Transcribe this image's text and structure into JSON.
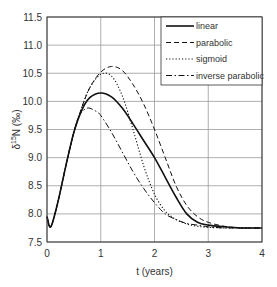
{
  "chart_data": {
    "type": "line",
    "title": "",
    "xlabel": "t (years)",
    "ylabel": "δ¹⁵N (‰)",
    "xlim": [
      0,
      4
    ],
    "ylim": [
      7.5,
      11.5
    ],
    "xticks": [
      "0",
      "1",
      "2",
      "3",
      "4"
    ],
    "yticks": [
      "7.5",
      "8.0",
      "8.5",
      "9.0",
      "9.5",
      "10.0",
      "10.5",
      "11.0",
      "11.5"
    ],
    "grid": true,
    "legend_position": "upper right",
    "series": [
      {
        "name": "linear",
        "style": "solid",
        "x": [
          0,
          0.07,
          0.2,
          0.35,
          0.5,
          0.65,
          0.8,
          1.0,
          1.2,
          1.4,
          1.6,
          1.8,
          2.0,
          2.2,
          2.4,
          2.6,
          2.8,
          3.0,
          3.3,
          3.6,
          4.0
        ],
        "y": [
          7.95,
          7.77,
          8.2,
          8.85,
          9.45,
          9.85,
          10.07,
          10.15,
          10.08,
          9.88,
          9.6,
          9.3,
          9.0,
          8.65,
          8.3,
          8.0,
          7.85,
          7.8,
          7.77,
          7.75,
          7.75
        ]
      },
      {
        "name": "parabolic",
        "style": "dashed",
        "x": [
          0,
          0.07,
          0.2,
          0.35,
          0.5,
          0.65,
          0.8,
          1.0,
          1.2,
          1.4,
          1.6,
          1.8,
          2.0,
          2.2,
          2.4,
          2.6,
          2.8,
          3.0,
          3.3,
          3.6,
          4.0
        ],
        "y": [
          7.95,
          7.77,
          8.2,
          8.85,
          9.45,
          9.9,
          10.25,
          10.52,
          10.62,
          10.55,
          10.3,
          9.95,
          9.5,
          9.0,
          8.5,
          8.15,
          7.95,
          7.85,
          7.78,
          7.75,
          7.75
        ]
      },
      {
        "name": "sigmoid",
        "style": "dotted",
        "x": [
          0,
          0.07,
          0.2,
          0.35,
          0.5,
          0.65,
          0.8,
          1.0,
          1.2,
          1.4,
          1.6,
          1.8,
          2.0,
          2.2,
          2.4,
          2.6,
          2.8,
          3.0,
          3.3,
          3.6,
          4.0
        ],
        "y": [
          7.95,
          7.77,
          8.2,
          8.85,
          9.45,
          9.9,
          10.25,
          10.48,
          10.45,
          10.1,
          9.5,
          8.85,
          8.35,
          8.05,
          7.9,
          7.82,
          7.78,
          7.76,
          7.75,
          7.75,
          7.75
        ]
      },
      {
        "name": "inverse parabolic",
        "style": "dashdot",
        "x": [
          0,
          0.07,
          0.2,
          0.35,
          0.5,
          0.6,
          0.75,
          0.9,
          1.0,
          1.2,
          1.4,
          1.6,
          1.8,
          2.0,
          2.2,
          2.4,
          2.6,
          2.8,
          3.0,
          3.3,
          3.6,
          4.0
        ],
        "y": [
          7.95,
          7.77,
          8.2,
          8.85,
          9.45,
          9.75,
          9.88,
          9.83,
          9.75,
          9.45,
          9.1,
          8.75,
          8.45,
          8.2,
          8.0,
          7.9,
          7.83,
          7.8,
          7.77,
          7.75,
          7.75,
          7.75
        ]
      }
    ]
  },
  "legend": {
    "items": [
      "linear",
      "parabolic",
      "sigmoid",
      "inverse parabolic"
    ]
  },
  "axes": {
    "xlabel": "t (years)",
    "ylabel_main": "δ",
    "ylabel_sup": "15",
    "ylabel_rest": "N (‰)"
  },
  "colors": {
    "line": "#111111",
    "grid": "#9a9a9a",
    "axis": "#333333"
  }
}
